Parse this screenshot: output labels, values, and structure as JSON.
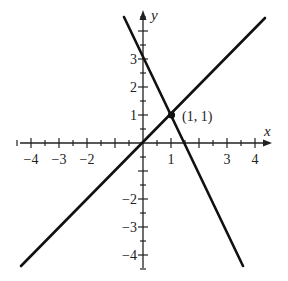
{
  "chart_data": {
    "type": "line",
    "title": "",
    "xlabel": "x",
    "ylabel": "y",
    "xlim": [
      -4.5,
      4.5
    ],
    "ylim": [
      -4.5,
      4.5
    ],
    "grid": false,
    "x_tick_labels": [
      "-4",
      "-3",
      "-2",
      "1",
      "3",
      "4"
    ],
    "y_tick_labels": [
      "3",
      "2",
      "1",
      "-2",
      "-3",
      "-4"
    ],
    "series": [
      {
        "name": "y = x",
        "x": [
          -4.4,
          4.4
        ],
        "y": [
          -4.4,
          4.4
        ]
      },
      {
        "name": "y = -2x + 3",
        "x": [
          -0.7,
          3.6
        ],
        "y": [
          4.4,
          -4.4
        ]
      }
    ],
    "annotations": [
      {
        "label": "(1, 1)",
        "x": 1,
        "y": 1,
        "marker": "dot"
      }
    ]
  },
  "axes": {
    "x_label": "x",
    "y_label": "y",
    "x_ticks": [
      {
        "text": "−4",
        "px": 31
      },
      {
        "text": "−3",
        "px": 59
      },
      {
        "text": "−2",
        "px": 87
      },
      {
        "text": "1",
        "px": 171
      },
      {
        "text": "3",
        "px": 227
      },
      {
        "text": "4",
        "px": 255
      }
    ],
    "y_ticks": [
      {
        "text": "3",
        "py": 59
      },
      {
        "text": "2",
        "py": 87
      },
      {
        "text": "1",
        "py": 115
      },
      {
        "text": "−2",
        "py": 199
      },
      {
        "text": "−3",
        "py": 227
      },
      {
        "text": "−4",
        "py": 255
      }
    ]
  },
  "point_label": "(1, 1)"
}
